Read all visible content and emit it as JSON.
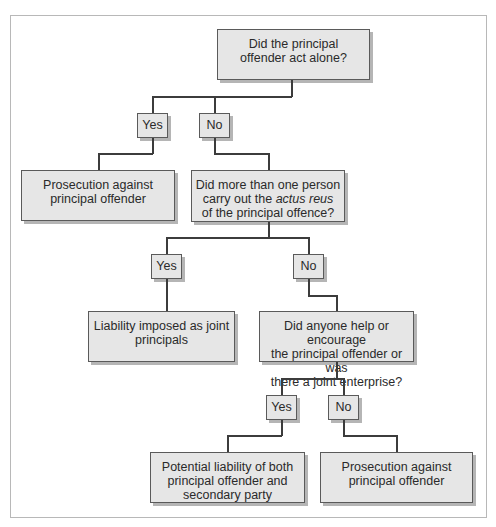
{
  "diagram": {
    "type": "flowchart",
    "colors": {
      "box_fill": "#e6e6e6",
      "box_border": "#5a5a5a",
      "shadow": "#b5b5b5",
      "line": "#3c3c3c",
      "frame": "#b8b8b8"
    },
    "nodes": {
      "q1": {
        "text": "Did the principal offender act alone?",
        "lines": [
          "Did the principal",
          "offender act alone?"
        ]
      },
      "yes1": {
        "text": "Yes"
      },
      "no1": {
        "text": "No"
      },
      "r1": {
        "text": "Prosecution against principal offender",
        "lines": [
          "Prosecution against",
          "principal offender"
        ]
      },
      "q2": {
        "text": "Did more than one person carry out the actus reus of the principal offence?",
        "lines": [
          "Did more than one person",
          "carry out the ",
          "actus reus",
          "of the principal offence?"
        ]
      },
      "yes2": {
        "text": "Yes"
      },
      "no2": {
        "text": "No"
      },
      "r2": {
        "text": "Liability imposed as joint principals",
        "lines": [
          "Liability imposed as joint",
          "principals"
        ]
      },
      "q3": {
        "text": "Did anyone help or encourage the principal offender or was there a joint enterprise?",
        "lines": [
          "Did anyone help or encourage",
          "the principal offender or was",
          "there a joint enterprise?"
        ]
      },
      "yes3": {
        "text": "Yes"
      },
      "no3": {
        "text": "No"
      },
      "r3": {
        "text": "Potential liability of both principal offender and secondary party",
        "lines": [
          "Potential liability of both",
          "principal offender and",
          "secondary party"
        ]
      },
      "r4": {
        "text": "Prosecution against principal offender",
        "lines": [
          "Prosecution against",
          "principal offender"
        ]
      }
    },
    "edges": [
      {
        "from": "q1",
        "to": "yes1"
      },
      {
        "from": "q1",
        "to": "no1"
      },
      {
        "from": "yes1",
        "to": "r1"
      },
      {
        "from": "no1",
        "to": "q2"
      },
      {
        "from": "q2",
        "to": "yes2"
      },
      {
        "from": "q2",
        "to": "no2"
      },
      {
        "from": "yes2",
        "to": "r2"
      },
      {
        "from": "no2",
        "to": "q3"
      },
      {
        "from": "q3",
        "to": "yes3"
      },
      {
        "from": "q3",
        "to": "no3"
      },
      {
        "from": "yes3",
        "to": "r3"
      },
      {
        "from": "no3",
        "to": "r4"
      }
    ]
  }
}
